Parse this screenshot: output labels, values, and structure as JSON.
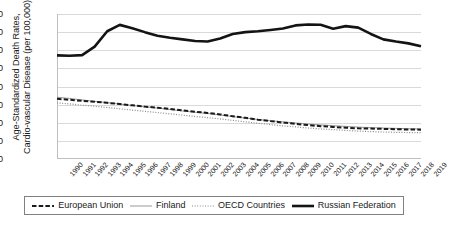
{
  "chart_data": {
    "type": "line",
    "title": "",
    "xlabel": "",
    "ylabel": "Age-Standardized Death Rates, Cardio-vascular Disease (per 100,000)",
    "ylabel_line1": "Age-Standardized Death Rates,",
    "ylabel_line2": "Cardio-vascular Disease (per 100,000)",
    "ylim": [
      0,
      800
    ],
    "ytick_labels": [
      "800",
      "700",
      "600",
      "500",
      "400",
      "300",
      "200",
      "100",
      "0"
    ],
    "ytick_values": [
      800,
      700,
      600,
      500,
      400,
      300,
      200,
      100,
      0
    ],
    "grid": true,
    "legend_position": "bottom",
    "categories": [
      "1990",
      "1991",
      "1992",
      "1993",
      "1994",
      "1995",
      "1996",
      "1997",
      "1998",
      "1999",
      "2000",
      "2001",
      "2002",
      "2003",
      "2004",
      "2005",
      "2006",
      "2007",
      "2008",
      "2009",
      "2010",
      "2011",
      "2012",
      "2013",
      "2014",
      "2015",
      "2016",
      "2017",
      "2018",
      "2019"
    ],
    "series": [
      {
        "name": "European Union",
        "style": "dashed",
        "color": "#1a1a1a",
        "width": 2.0,
        "values": [
          332,
          327,
          321,
          316,
          310,
          303,
          296,
          289,
          283,
          276,
          268,
          261,
          254,
          246,
          236,
          227,
          217,
          209,
          201,
          194,
          187,
          181,
          177,
          173,
          169,
          168,
          166,
          164,
          163,
          162
        ]
      },
      {
        "name": "Finland",
        "style": "solid-thin",
        "color": "#9a9a9a",
        "width": 1.0,
        "values": [
          341,
          334,
          326,
          318,
          311,
          303,
          295,
          288,
          281,
          273,
          265,
          258,
          251,
          243,
          234,
          226,
          218,
          211,
          205,
          199,
          193,
          188,
          184,
          180,
          176,
          173,
          171,
          169,
          167,
          166
        ]
      },
      {
        "name": "OECD Countries",
        "style": "dotted",
        "color": "#8a8a8a",
        "width": 1.2,
        "values": [
          310,
          304,
          297,
          291,
          284,
          277,
          270,
          263,
          256,
          249,
          242,
          235,
          228,
          221,
          213,
          205,
          197,
          190,
          183,
          177,
          171,
          166,
          162,
          158,
          154,
          151,
          149,
          147,
          146,
          145
        ]
      },
      {
        "name": "Russian Federation",
        "style": "solid-thick",
        "color": "#141414",
        "width": 2.6,
        "values": [
          572,
          570,
          573,
          620,
          705,
          740,
          722,
          700,
          680,
          669,
          660,
          651,
          648,
          665,
          690,
          700,
          705,
          712,
          720,
          737,
          742,
          741,
          719,
          733,
          725,
          690,
          660,
          648,
          638,
          622
        ]
      }
    ]
  },
  "legend": {
    "items": [
      {
        "label": "European Union",
        "icon": "dashed-line-swatch"
      },
      {
        "label": "Finland",
        "icon": "thin-line-swatch"
      },
      {
        "label": "OECD Countries",
        "icon": "dotted-line-swatch"
      },
      {
        "label": "Russian Federation",
        "icon": "thick-line-swatch"
      }
    ]
  }
}
